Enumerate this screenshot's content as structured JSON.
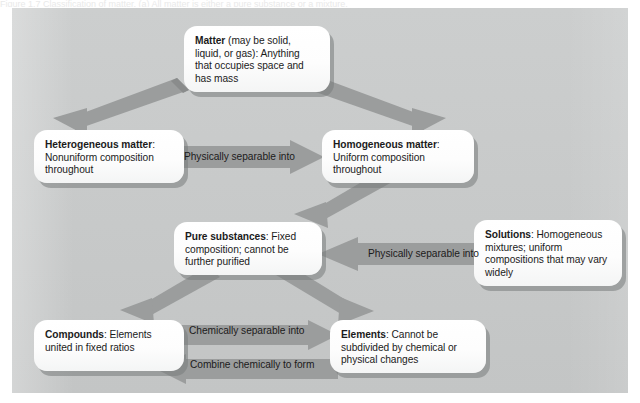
{
  "figure": {
    "caption_sliver": "Figure 1.7   Classification of matter. (a) All matter is either a pure substance or a mixture.",
    "panel_color": "#c9cbcb",
    "box_color": "#ffffff",
    "arrow_color": "#9b9d9d",
    "shadow_color": "#787c7c",
    "text_color": "#1b1b1b"
  },
  "nodes": {
    "matter": {
      "id": "matter",
      "term": "Matter",
      "description": " (may be solid, liquid, or gas): Anything that occupies space and has mass"
    },
    "heterogeneous": {
      "id": "heterogeneous-matter",
      "term": "Heterogeneous matter",
      "description": ": Nonuniform composition throughout"
    },
    "homogeneous": {
      "id": "homogeneous-matter",
      "term": "Homogeneous matter",
      "description": ": Uniform composition throughout"
    },
    "pure_substances": {
      "id": "pure-substances",
      "term": "Pure substances",
      "description": ": Fixed composition; cannot be further purified"
    },
    "solutions": {
      "id": "solutions",
      "term": "Solutions",
      "description": ": Homogeneous mixtures; uniform compositions that may vary widely"
    },
    "compounds": {
      "id": "compounds",
      "term": "Compounds",
      "description": ": Elements united in fixed ratios"
    },
    "elements": {
      "id": "elements",
      "term": "Elements",
      "description": ": Cannot be subdivided by chemical or physical changes"
    }
  },
  "arrows": [
    {
      "id": "matter-to-heterogeneous",
      "label": "",
      "from": "matter",
      "to": "heterogeneous",
      "direction": "down-left"
    },
    {
      "id": "matter-to-homogeneous",
      "label": "",
      "from": "matter",
      "to": "homogeneous",
      "direction": "down-right"
    },
    {
      "id": "heterogeneous-to-homogeneous",
      "label": "Physically separable into",
      "from": "heterogeneous",
      "to": "homogeneous",
      "direction": "right"
    },
    {
      "id": "homogeneous-to-pure-substances",
      "label": "",
      "from": "homogeneous",
      "to": "pure_substances",
      "direction": "down-left"
    },
    {
      "id": "solutions-to-pure-substances",
      "label": "Physically separable into",
      "from": "solutions",
      "to": "pure_substances",
      "direction": "left"
    },
    {
      "id": "pure-substances-to-compounds",
      "label": "",
      "from": "pure_substances",
      "to": "compounds",
      "direction": "down-left"
    },
    {
      "id": "pure-substances-to-elements",
      "label": "",
      "from": "pure_substances",
      "to": "elements",
      "direction": "down-right"
    },
    {
      "id": "compounds-to-elements",
      "label": "Chemically separable into",
      "from": "compounds",
      "to": "elements",
      "direction": "right"
    },
    {
      "id": "elements-to-compounds",
      "label": "Combine chemically to form",
      "from": "elements",
      "to": "compounds",
      "direction": "left"
    }
  ]
}
